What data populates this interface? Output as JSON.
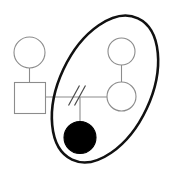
{
  "diagram": {
    "type": "pedigree-chart",
    "canvas": {
      "width": 173,
      "height": 175,
      "background": "#ffffff"
    },
    "colors": {
      "symbol_outline": "#8c8c8c",
      "connector_line": "#8c8c8c",
      "affected_fill": "#000000",
      "grouping_outline": "#111111",
      "slash_mark": "#4a4a4a",
      "canvas_background": "#ffffff"
    },
    "stroke_widths": {
      "symbol_outline": 1.1,
      "connector_line": 1.1,
      "grouping_outline": 2.6,
      "slash_mark": 1.2
    },
    "symbols": [
      {
        "id": "female-upper-left",
        "shape": "circle",
        "sex": "female",
        "affected": false,
        "fill": "none",
        "stroke": "#8c8c8c",
        "cx": 29.5,
        "cy": 52.5,
        "r": 15.5
      },
      {
        "id": "male-left",
        "shape": "square",
        "sex": "male",
        "affected": false,
        "fill": "none",
        "stroke": "#8c8c8c",
        "x": 14.5,
        "y": 82.5,
        "width": 31,
        "height": 31
      },
      {
        "id": "female-upper-right",
        "shape": "circle",
        "sex": "female",
        "affected": false,
        "fill": "none",
        "stroke": "#8c8c8c",
        "cx": 121.5,
        "cy": 51.5,
        "r": 13.5
      },
      {
        "id": "female-lower-right",
        "shape": "circle",
        "sex": "female",
        "affected": false,
        "fill": "none",
        "stroke": "#8c8c8c",
        "cx": 121.5,
        "cy": 96.5,
        "r": 14.5
      },
      {
        "id": "female-affected-offspring",
        "shape": "circle",
        "sex": "female",
        "affected": true,
        "fill": "#000000",
        "stroke": "#000000",
        "cx": 80,
        "cy": 137.5,
        "r": 16
      }
    ],
    "connectors": [
      {
        "id": "descent-line-upperleft-to-male",
        "kind": "vertical",
        "x1": 29.5,
        "y1": 68,
        "x2": 29.5,
        "y2": 82.5
      },
      {
        "id": "descent-line-upperright-to-lowerright",
        "kind": "vertical",
        "x1": 121.5,
        "y1": 65,
        "x2": 121.5,
        "y2": 82
      },
      {
        "id": "mating-line-male-to-lowerright-female",
        "kind": "horizontal",
        "x1": 45.5,
        "y1": 97,
        "x2": 107,
        "y2": 97
      },
      {
        "id": "sibship-drop-line-to-offspring",
        "kind": "vertical",
        "x1": 80,
        "y1": 97,
        "x2": 80,
        "y2": 121.5
      }
    ],
    "slash_marks": {
      "id": "relationship-terminated-slashes",
      "meaning": "double-slash-on-mating-line",
      "count": 2,
      "stroke": "#4a4a4a",
      "lines": [
        {
          "x1": 68.5,
          "y1": 105.5,
          "x2": 79.5,
          "y2": 85.5
        },
        {
          "x1": 74.5,
          "y1": 105.5,
          "x2": 85.5,
          "y2": 85.5
        }
      ]
    },
    "grouping_ellipse": {
      "id": "household-grouping-ellipse",
      "cx": 105,
      "cy": 89,
      "rx": 46,
      "ry": 78,
      "rotation_deg": 25,
      "stroke": "#111111",
      "fill": "none"
    }
  }
}
